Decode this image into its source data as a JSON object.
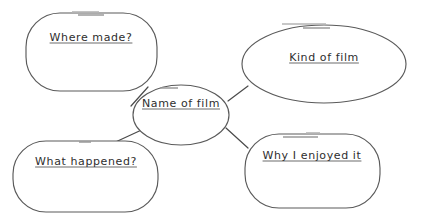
{
  "document": {
    "type": "mind-map-worksheet",
    "title": "Film review mind map",
    "background_color": "#ffffff",
    "outline_color": "#5a5a5a",
    "text_color": "#2e2e2e",
    "accent_dash_color": "#9a9a9a"
  },
  "nodes": {
    "center": {
      "id": "name-of-film",
      "label": "Name of film",
      "shape": "ellipse",
      "role": "central-topic",
      "cx": 181,
      "cy": 115,
      "rx": 48,
      "ry": 30,
      "label_x": 181,
      "label_y": 103
    },
    "branches": [
      {
        "id": "where-made",
        "label": "Where made?",
        "shape": "rounded-rectangle",
        "x": 26,
        "y": 13,
        "width": 131,
        "height": 78,
        "radius": 34,
        "label_x": 91,
        "label_y": 37
      },
      {
        "id": "kind-of-film",
        "label": "Kind of film",
        "shape": "ellipse",
        "cx": 324,
        "cy": 64,
        "rx": 82,
        "ry": 39,
        "label_x": 324,
        "label_y": 57
      },
      {
        "id": "what-happened",
        "label": "What happened?",
        "shape": "rounded-rectangle",
        "x": 13,
        "y": 141,
        "width": 145,
        "height": 71,
        "radius": 33,
        "label_x": 86,
        "label_y": 161
      },
      {
        "id": "why-i-enjoyed-it",
        "label": "Why I enjoyed it",
        "shape": "rounded-rectangle",
        "x": 245,
        "y": 134,
        "width": 135,
        "height": 74,
        "radius": 34,
        "label_x": 312,
        "label_y": 155
      }
    ]
  },
  "connectors": [
    {
      "id": "center-to-where-made",
      "from": "name-of-film",
      "to": "where-made",
      "x1": 148,
      "y1": 87,
      "x2": 131,
      "y2": 106
    },
    {
      "id": "center-to-kind-of-film",
      "from": "name-of-film",
      "to": "kind-of-film",
      "x1": 228,
      "y1": 101,
      "x2": 248,
      "y2": 86
    },
    {
      "id": "center-to-what-happened",
      "from": "name-of-film",
      "to": "what-happened",
      "x1": 148,
      "y1": 127,
      "x2": 109,
      "y2": 145
    },
    {
      "id": "center-to-why-enjoyed",
      "from": "name-of-film",
      "to": "why-i-enjoyed-it",
      "x1": 226,
      "y1": 128,
      "x2": 248,
      "y2": 148
    }
  ],
  "decorative_dashes": [
    {
      "id": "dash-where-made-upper",
      "x1": 72,
      "y1": 12,
      "x2": 99,
      "y2": 12
    },
    {
      "id": "dash-where-made-lower",
      "x1": 78,
      "y1": 15,
      "x2": 104,
      "y2": 15
    },
    {
      "id": "dash-kind-of-film-upper",
      "x1": 282,
      "y1": 24,
      "x2": 326,
      "y2": 24
    },
    {
      "id": "dash-kind-of-film-lower",
      "x1": 303,
      "y1": 28,
      "x2": 330,
      "y2": 28
    },
    {
      "id": "dash-center-node",
      "x1": 160,
      "y1": 88,
      "x2": 178,
      "y2": 88
    },
    {
      "id": "dash-what-happened",
      "x1": 79,
      "y1": 142,
      "x2": 91,
      "y2": 142
    },
    {
      "id": "dash-why-enjoyed-upper",
      "x1": 306,
      "y1": 133,
      "x2": 320,
      "y2": 133
    },
    {
      "id": "dash-why-enjoyed-lower",
      "x1": 283,
      "y1": 137,
      "x2": 318,
      "y2": 137
    }
  ]
}
